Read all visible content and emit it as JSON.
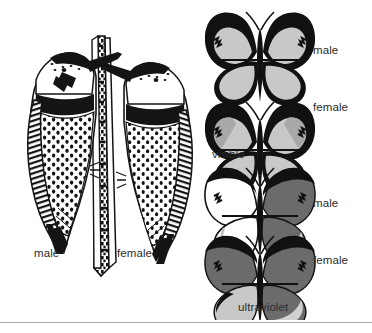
{
  "figure": {
    "width": 372,
    "height": 333,
    "background_color": "#ffffff",
    "rule_color": "#a9a9a9"
  },
  "birds": {
    "description": "Ink line drawing of two Northern Flicker woodpeckers clinging to a tree trunk, facing one another",
    "left_bird_label": "male",
    "right_bird_label": "female",
    "ink_color": "#111111"
  },
  "butterflies": {
    "ink_color": "#111111",
    "light_gray": "#c8c8c8",
    "dark_gray": "#6b6b6b",
    "white": "#ffffff",
    "group_labels": {
      "visible": "visible",
      "ultraviolet": "ultraviolet"
    },
    "rows": [
      {
        "id": "male-visible",
        "label": "male",
        "lighting": "visible",
        "left_wing_fill": "#c8c8c8",
        "right_wing_fill": "#c8c8c8"
      },
      {
        "id": "female-visible",
        "label": "female",
        "lighting": "visible",
        "left_wing_fill": "#c8c8c8",
        "right_wing_fill": "#c8c8c8"
      },
      {
        "id": "male-ultraviolet",
        "label": "male",
        "lighting": "ultraviolet",
        "left_wing_fill": "#ffffff",
        "right_wing_fill": "#6b6b6b"
      },
      {
        "id": "female-ultraviolet",
        "label": "female",
        "lighting": "ultraviolet",
        "left_wing_fill": "#6b6b6b",
        "right_wing_fill": "#6b6b6b"
      }
    ]
  }
}
